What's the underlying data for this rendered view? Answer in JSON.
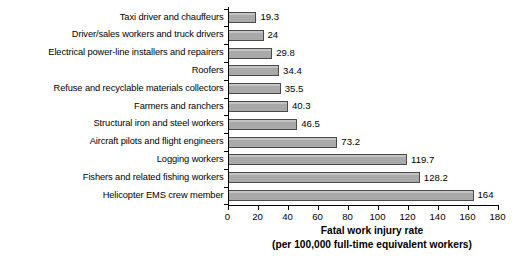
{
  "chart_data": {
    "type": "bar",
    "orientation": "horizontal",
    "title": "",
    "xlabel": "Fatal work injury rate (per 100,000 full-time equivalent workers)",
    "xlabel_line1": "Fatal work injury rate",
    "xlabel_line2": "(per 100,000 full-time equivalent workers)",
    "ylabel": "",
    "xlim": [
      0,
      180
    ],
    "xticks": [
      0,
      20,
      40,
      60,
      80,
      100,
      120,
      140,
      160,
      180
    ],
    "grid": false,
    "legend": false,
    "bar_fill_color": "#a9a9a9",
    "bar_edge_color": "#4a4a4a",
    "categories": [
      "Taxi driver and chauffeurs",
      "Driver/sales workers and truck drivers",
      "Electrical power-line installers and repairers",
      "Roofers",
      "Refuse and recyclable materials collectors",
      "Farmers and ranchers",
      "Structural iron and steel workers",
      "Aircraft pilots and flight engineers",
      "Logging workers",
      "Fishers and related fishing workers",
      "Helicopter EMS crew member"
    ],
    "values": [
      19.3,
      24,
      29.8,
      34.4,
      35.5,
      40.3,
      46.5,
      73.2,
      119.7,
      128.2,
      164
    ],
    "value_labels": [
      "19.3",
      "24",
      "29.8",
      "34.4",
      "35.5",
      "40.3",
      "46.5",
      "73.2",
      "119.7",
      "128.2",
      "164"
    ]
  }
}
